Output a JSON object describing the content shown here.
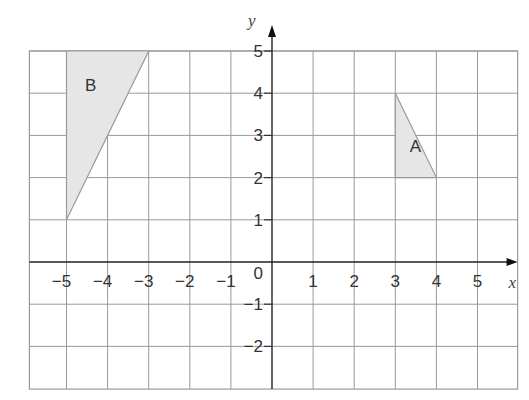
{
  "figure": {
    "x_axis_label": "x",
    "y_axis_label": "y",
    "origin_label": "0",
    "x_range": [
      -6,
      6
    ],
    "y_range": [
      -3,
      5
    ],
    "x_ticks": [
      -5,
      -4,
      -3,
      -2,
      -1,
      1,
      2,
      3,
      4,
      5
    ],
    "x_tick_labels": [
      "−5",
      "−4",
      "−3",
      "−2",
      "−1",
      "1",
      "2",
      "3",
      "4",
      "5"
    ],
    "y_ticks": [
      5,
      4,
      3,
      2,
      1,
      -1,
      -2
    ],
    "y_tick_labels": [
      "5",
      "4",
      "3",
      "2",
      "1",
      "−1",
      "−2"
    ],
    "colors": {
      "grid": "#9a9a9a",
      "shape_fill": "#e6e6e6",
      "axis": "#222222"
    },
    "shapes": [
      {
        "label": "A",
        "vertices": [
          [
            3,
            4
          ],
          [
            3,
            2
          ],
          [
            4,
            2
          ]
        ],
        "label_pos": [
          3.35,
          2.6
        ]
      },
      {
        "label": "B",
        "vertices": [
          [
            -5,
            5
          ],
          [
            -3,
            5
          ],
          [
            -5,
            1
          ]
        ],
        "label_pos": [
          -4.55,
          4.05
        ]
      }
    ]
  }
}
